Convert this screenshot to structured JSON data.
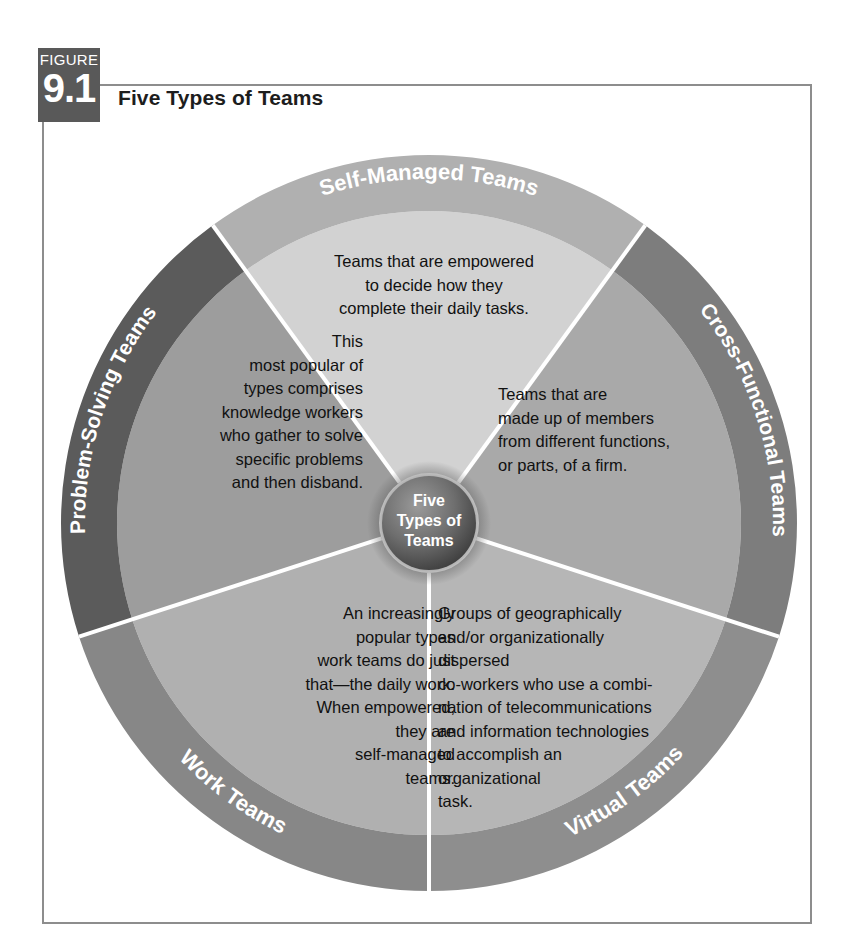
{
  "figure": {
    "badge_word": "FIGURE",
    "number": "9.1",
    "title": "Five Types of Teams"
  },
  "hub": {
    "line1": "Five",
    "line2": "Types of",
    "line3": "Teams"
  },
  "colors": {
    "frame_border": "#8d8d8d",
    "badge_bg": "#595959",
    "title_text": "#1d1d1d",
    "body_text": "#111111",
    "label_text": "#ffffff",
    "hub_outer": "#4f4f4f",
    "hub_inner": "#8f8f8f",
    "divider": "#ffffff"
  },
  "chart_data": {
    "type": "pie",
    "title": "Five Types of Teams",
    "center_label": "Five Types of Teams",
    "segment_count": 5,
    "segment_degrees": 72,
    "categories": [
      "Self-Managed Teams",
      "Cross-Functional Teams",
      "Virtual Teams",
      "Work Teams",
      "Problem-Solving Teams"
    ],
    "values": [
      20,
      20,
      20,
      20,
      20
    ]
  },
  "segments": [
    {
      "key": "self-managed",
      "label": "Self-Managed Teams",
      "ring_color": "#b0b0b0",
      "wedge_color": "#d2d2d2",
      "start_deg": -36,
      "end_deg": 36,
      "body": "Teams that are empowered\nto decide how they\ncomplete their daily tasks.",
      "align": "center"
    },
    {
      "key": "cross-functional",
      "label": "Cross-Functional Teams",
      "ring_color": "#7d7d7d",
      "wedge_color": "#a9a9a9",
      "start_deg": 36,
      "end_deg": 108,
      "body": "Teams that are\nmade up of members\nfrom different functions,\nor parts, of a firm.",
      "align": "left"
    },
    {
      "key": "virtual",
      "label": "Virtual Teams",
      "ring_color": "#8e8e8e",
      "wedge_color": "#b6b6b6",
      "start_deg": 108,
      "end_deg": 180,
      "body": "Groups of geographically\nand/or organizationally dispersed\nco-workers who use a combi-\nnation of telecommunications\nand information technologies\nto accomplish an\norganizational\ntask.",
      "align": "left"
    },
    {
      "key": "work",
      "label": "Work Teams",
      "ring_color": "#878787",
      "wedge_color": "#b0b0b0",
      "start_deg": 180,
      "end_deg": 252,
      "body": "An increasingly\npopular types\nwork teams do just\nthat—the daily work.\nWhen empowered,\nthey are\nself-managed\nteams.",
      "align": "right"
    },
    {
      "key": "problem-solving",
      "label": "Problem-Solving Teams",
      "ring_color": "#5b5b5b",
      "wedge_color": "#9d9d9d",
      "start_deg": 252,
      "end_deg": 324,
      "body": "This\nmost popular of\ntypes comprises\nknowledge workers\nwho gather to solve\nspecific problems\nand then disband.",
      "align": "right"
    }
  ]
}
